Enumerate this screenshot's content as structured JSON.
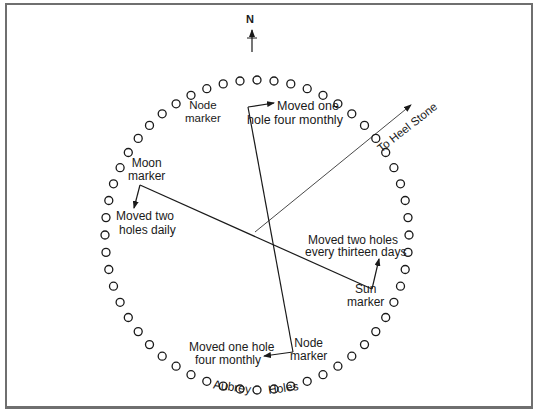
{
  "compass": {
    "north_label": "N"
  },
  "labels": {
    "node_top": [
      "Node",
      "marker"
    ],
    "node_top_move": [
      "Moved one",
      "hole four monthly"
    ],
    "heel_stone": "To Heel Stone",
    "moon": [
      "Moon",
      "marker"
    ],
    "moon_move": [
      "Moved two",
      "holes daily"
    ],
    "sun_move": [
      "Moved two holes",
      "every thirteen days"
    ],
    "sun": [
      "Sun",
      "marker"
    ],
    "node_bottom": [
      "Node",
      "marker"
    ],
    "node_bottom_move": [
      "Moved one hole",
      "four monthly"
    ],
    "aubrey": "Aubrey",
    "holes": "Holes"
  },
  "colors": {
    "ink": "#1a1a1a",
    "frame": "#6f6f6f",
    "background": "#ffffff"
  },
  "circle": {
    "center": [
      257,
      235
    ],
    "holes": 56,
    "rx": 152,
    "ry": 155
  }
}
